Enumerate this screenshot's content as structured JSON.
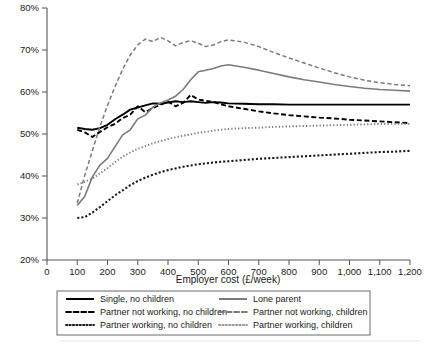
{
  "chart_data": {
    "type": "line",
    "title": "",
    "xlabel": "Employer cost (£/week)",
    "ylabel": "",
    "xlim": [
      0,
      1200
    ],
    "ylim": [
      20,
      80
    ],
    "grid": false,
    "legend_position": "bottom",
    "y_ticks": [
      "20%",
      "30%",
      "40%",
      "50%",
      "60%",
      "70%",
      "80%"
    ],
    "y_tick_values": [
      20,
      30,
      40,
      50,
      60,
      70,
      80
    ],
    "x_ticks": [
      "0",
      "100",
      "200",
      "300",
      "400",
      "500",
      "600",
      "700",
      "800",
      "900",
      "1,000",
      "1,100",
      "1,200"
    ],
    "x_tick_values": [
      0,
      100,
      200,
      300,
      400,
      500,
      600,
      700,
      800,
      900,
      1000,
      1100,
      1200
    ],
    "x": [
      100,
      125,
      150,
      175,
      200,
      225,
      250,
      275,
      300,
      325,
      350,
      375,
      400,
      425,
      450,
      475,
      500,
      525,
      550,
      575,
      600,
      650,
      700,
      750,
      800,
      850,
      900,
      950,
      1000,
      1050,
      1100,
      1150,
      1200
    ],
    "series": [
      {
        "name": "Single, no children",
        "style": "solid",
        "color": "#000000",
        "width": 1.9,
        "values": [
          51.5,
          51.2,
          51.0,
          51.4,
          52.2,
          53.5,
          54.6,
          55.8,
          56.3,
          56.8,
          57.3,
          57.2,
          57.5,
          57.8,
          57.6,
          57.8,
          57.6,
          57.4,
          57.6,
          57.5,
          57.3,
          57.2,
          57.1,
          57.1,
          57.0,
          57.0,
          57.0,
          57.0,
          57.0,
          57.0,
          57.0,
          57.0,
          57.0
        ]
      },
      {
        "name": "Partner not working, no children",
        "style": "dashed",
        "color": "#000000",
        "width": 1.9,
        "values": [
          51.0,
          50.4,
          49.3,
          50.5,
          51.6,
          52.4,
          53.8,
          54.6,
          56.6,
          55.2,
          56.2,
          57.0,
          57.7,
          56.6,
          57.4,
          59.3,
          58.2,
          57.9,
          57.6,
          57.1,
          56.6,
          56.0,
          55.4,
          54.9,
          54.5,
          54.2,
          53.9,
          53.7,
          53.4,
          53.2,
          53.0,
          52.8,
          52.6
        ]
      },
      {
        "name": "Partner working, no children",
        "style": "dotted",
        "color": "#7b7b7b",
        "width": 1.9,
        "values": [
          38.0,
          38.6,
          39.4,
          40.6,
          41.9,
          43.3,
          44.6,
          45.6,
          46.5,
          47.1,
          47.8,
          48.3,
          48.8,
          49.2,
          49.6,
          49.9,
          50.3,
          50.5,
          50.8,
          51.0,
          51.2,
          51.4,
          51.5,
          51.7,
          51.8,
          51.9,
          52.0,
          52.1,
          52.2,
          52.3,
          52.4,
          52.4,
          52.4
        ]
      },
      {
        "name": "Lone parent",
        "style": "solid",
        "color": "#7b7b7b",
        "width": 1.6,
        "values": [
          33.0,
          35.2,
          39.8,
          42.6,
          44.2,
          47.0,
          49.8,
          51.0,
          53.6,
          54.5,
          56.4,
          57.4,
          58.1,
          59.0,
          60.6,
          62.9,
          64.8,
          65.2,
          65.6,
          66.2,
          66.5,
          65.9,
          65.2,
          64.4,
          63.6,
          62.9,
          62.4,
          61.8,
          61.3,
          60.9,
          60.6,
          60.4,
          60.2
        ]
      },
      {
        "name": "Partner not working, children",
        "style": "dashed",
        "color": "#7b7b7b",
        "width": 1.5,
        "values": [
          33.5,
          40.2,
          46.0,
          51.8,
          56.8,
          61.3,
          65.4,
          68.8,
          71.2,
          72.6,
          72.0,
          73.0,
          72.2,
          71.0,
          71.8,
          72.2,
          71.6,
          70.8,
          71.2,
          72.0,
          72.4,
          71.9,
          70.8,
          69.4,
          68.1,
          66.9,
          65.7,
          64.6,
          63.6,
          62.8,
          62.2,
          61.8,
          61.5
        ]
      },
      {
        "name": "Partner working, children",
        "style": "dotted-bold",
        "color": "#1a1a1a",
        "width": 2.1,
        "values": [
          30.0,
          30.2,
          31.3,
          32.6,
          34.0,
          35.4,
          36.6,
          37.8,
          38.8,
          39.6,
          40.3,
          40.9,
          41.4,
          41.8,
          42.2,
          42.5,
          42.8,
          43.0,
          43.2,
          43.4,
          43.5,
          43.8,
          44.1,
          44.3,
          44.5,
          44.7,
          44.9,
          45.1,
          45.3,
          45.5,
          45.7,
          45.8,
          46.0
        ]
      }
    ]
  },
  "legend": {
    "entries": [
      {
        "label": "Single, no children",
        "style": "solid",
        "color": "#000000"
      },
      {
        "label": "Lone parent",
        "style": "solid",
        "color": "#7b7b7b"
      },
      {
        "label": "Partner not working, no children",
        "style": "dashed",
        "color": "#000000"
      },
      {
        "label": "Partner not working, children",
        "style": "dashed",
        "color": "#7b7b7b"
      },
      {
        "label": "Partner working, no children",
        "style": "dotted",
        "color": "#1a1a1a"
      },
      {
        "label": "Partner working, children",
        "style": "dotted",
        "color": "#9a9a9a"
      }
    ]
  }
}
